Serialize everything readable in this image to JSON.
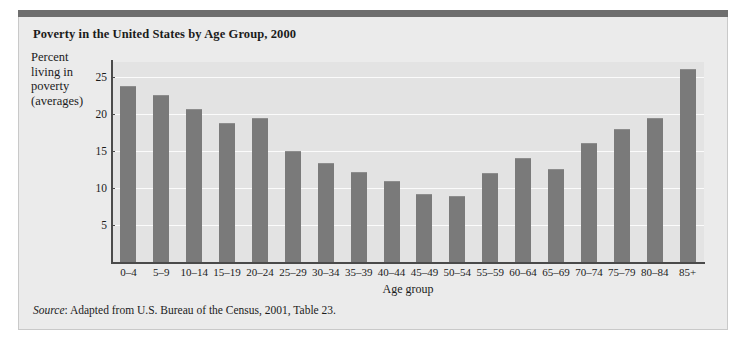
{
  "figure": {
    "title": "Poverty in the United States by Age Group, 2000",
    "source_label": "Source",
    "source_text": ": Adapted from U.S. Bureau of the Census, 2001, Table 23.",
    "y_caption_lines": [
      "Percent",
      "living in",
      "poverty",
      "(averages)"
    ],
    "colors": {
      "bar": "#7a7a7a",
      "plot_background": "#e3e3e3",
      "figure_background": "#ebebeb",
      "gridline": "#fbfbfb",
      "axis": "#4a4a4a",
      "top_rule": "#6e6e6e",
      "text": "#1b1b1b"
    }
  },
  "chart_data": {
    "type": "bar",
    "title": "Poverty in the United States by Age Group, 2000",
    "xlabel": "Age group",
    "ylabel": "Percent living in poverty (averages)",
    "ylim": [
      0,
      27
    ],
    "yticks": [
      5,
      10,
      15,
      20,
      25
    ],
    "grid": true,
    "legend": null,
    "categories": [
      "0–4",
      "5–9",
      "10–14",
      "15–19",
      "20–24",
      "25–29",
      "30–34",
      "35–39",
      "40–44",
      "45–49",
      "50–54",
      "55–59",
      "60–64",
      "65–69",
      "70–74",
      "75–79",
      "80–84",
      "85+"
    ],
    "values": [
      23.8,
      22.5,
      20.6,
      18.8,
      19.4,
      15.0,
      13.4,
      12.1,
      11.0,
      9.2,
      8.9,
      12.0,
      14.0,
      12.6,
      16.0,
      18.0,
      19.4,
      26.1
    ]
  }
}
